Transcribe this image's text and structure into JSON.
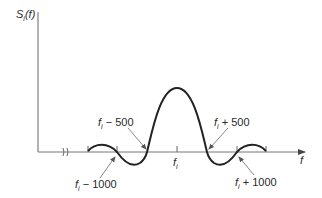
{
  "diagram": {
    "y_axis_label": "S",
    "y_axis_sub": "i",
    "y_axis_arg": "(f)",
    "x_axis_label": "f",
    "center_label": "f",
    "center_sub": "i",
    "annotations": [
      {
        "base": "f",
        "sub": "i",
        "text": " − 500"
      },
      {
        "base": "f",
        "sub": "i",
        "text": " + 500"
      },
      {
        "base": "f",
        "sub": "i",
        "text": " − 1000"
      },
      {
        "base": "f",
        "sub": "i",
        "text": " + 1000"
      }
    ],
    "axis_break_symbol": "≈"
  }
}
